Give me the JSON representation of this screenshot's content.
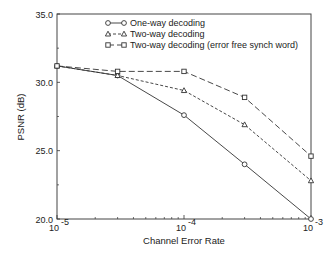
{
  "chart_data": {
    "type": "line",
    "title": "",
    "xlabel": "Channel Error Rate",
    "ylabel": "PSNR (dB)",
    "xscale": "log",
    "xlim": [
      1e-05,
      0.001
    ],
    "ylim": [
      20.0,
      35.0
    ],
    "xticks": [
      {
        "value": 1e-05,
        "base": "10",
        "exp": "-5"
      },
      {
        "value": 0.0001,
        "base": "10",
        "exp": "-4"
      },
      {
        "value": 0.001,
        "base": "10",
        "exp": "-3"
      }
    ],
    "yticks": [
      "20.0",
      "25.0",
      "30.0",
      "35.0"
    ],
    "grid": false,
    "legend_position": "upper right",
    "x": [
      1e-05,
      3e-05,
      0.0001,
      0.0003,
      0.001
    ],
    "series": [
      {
        "name": "One-way decoding",
        "marker": "circle",
        "line": "solid",
        "values": [
          31.2,
          30.5,
          27.6,
          24.0,
          20.0
        ]
      },
      {
        "name": "Two-way decoding",
        "marker": "triangle",
        "line": "short-dash",
        "values": [
          31.2,
          30.5,
          29.4,
          26.9,
          22.8
        ]
      },
      {
        "name": "Two-way decoding (error free synch word)",
        "marker": "square",
        "line": "long-dash",
        "values": [
          31.2,
          30.8,
          30.8,
          28.9,
          24.6
        ]
      }
    ]
  }
}
